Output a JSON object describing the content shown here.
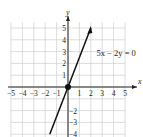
{
  "chart_data": {
    "type": "line",
    "title": "",
    "equation_label": "5x − 2y = 0",
    "xlabel": "x",
    "ylabel": "y",
    "xlim": [
      -5,
      5
    ],
    "ylim": [
      -4,
      5
    ],
    "x_ticks": [
      -5,
      -4,
      -3,
      -2,
      -1,
      1,
      2,
      3,
      4,
      5
    ],
    "y_ticks": [
      -4,
      -3,
      -2,
      -1,
      1,
      2,
      3,
      4,
      5
    ],
    "x_tick_labels": [
      "−5",
      "−4",
      "−3",
      "−2",
      "−1",
      "1",
      "2",
      "3",
      "4",
      "5"
    ],
    "y_tick_labels_pos": [
      "1",
      "2",
      "3",
      "4",
      "5"
    ],
    "y_tick_labels_neg": [
      "−2",
      "−3",
      "−4"
    ],
    "grid": true,
    "series": [
      {
        "name": "5x − 2y = 0",
        "x": [
          -1.6,
          0,
          2
        ],
        "y": [
          -4,
          0,
          5
        ],
        "slope": 2.5,
        "intercept": 0,
        "arrow_end": [
          2,
          5
        ]
      }
    ],
    "points": [
      {
        "x": 0,
        "y": 0,
        "label": "origin"
      }
    ]
  },
  "colors": {
    "grid": "#cfcfcf",
    "axis": "#222222",
    "line": "#111111",
    "text": "#222222"
  }
}
